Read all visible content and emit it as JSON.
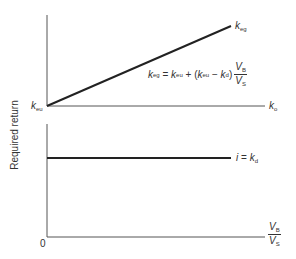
{
  "diagram": {
    "y_axis_label": "Required return",
    "upper_panel": {
      "x_axis_label": {
        "main": "k",
        "sub": "o"
      },
      "origin_label": {
        "main": "k",
        "sub": "eu"
      },
      "line_label": {
        "main": "k",
        "sub": "eg"
      },
      "formula": {
        "lhs_main": "k",
        "lhs_sub": "eg",
        "eq": " = ",
        "t1_main": "k",
        "t1_sub": "eu",
        "plus": " + (",
        "t2_main": "k",
        "t2_sub": "eu",
        "minus": " − ",
        "t3_main": "k",
        "t3_sub": "d",
        "close": ")",
        "frac_num_main": "V",
        "frac_num_sub": "B",
        "frac_den_main": "V",
        "frac_den_sub": "S"
      }
    },
    "lower_panel": {
      "line_label": {
        "prefix": "i",
        "eq": " = ",
        "main": "k",
        "sub": "d"
      },
      "origin_label": "0",
      "x_axis_label": {
        "num_main": "V",
        "num_sub": "B",
        "den_main": "V",
        "den_sub": "S"
      }
    },
    "colors": {
      "axis": "#555555",
      "line": "#222222",
      "background": "#ffffff"
    }
  }
}
